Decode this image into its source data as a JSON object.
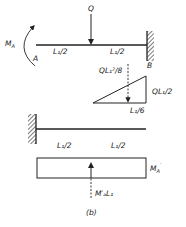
{
  "figure": {
    "caption": "(b)",
    "load_label": "Q",
    "moment_label_main": "M",
    "moment_label_sub": "A",
    "support_left_label": "A",
    "support_right_label": "B",
    "span_top_left": "L₁/2",
    "span_top_right": "L₁/2",
    "triangle_resultant_label": "QL₁²/8",
    "triangle_height_label": "QL₁/2",
    "triangle_centroid_label": "L₁/6",
    "span_bottom_left": "L₁/2",
    "span_bottom_right": "L₁/2",
    "rect_height_label_main": "M",
    "rect_height_label_sub": "A",
    "rect_height_label_sup": "′",
    "rect_resultant_label": "M′ₐL₁"
  },
  "colors": {
    "ink": "#222222",
    "background": "#ffffff"
  }
}
